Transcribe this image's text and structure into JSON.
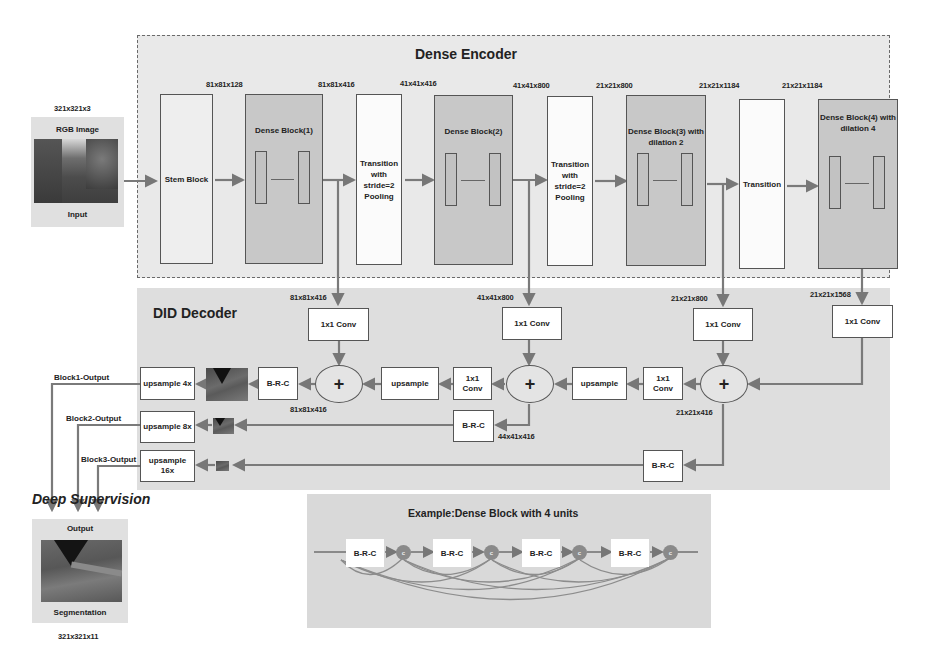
{
  "encoder": {
    "title": "Dense Encoder",
    "input": {
      "dim": "321x321x3",
      "top_label": "RGB Image",
      "bottom_label": "Input"
    },
    "blocks": [
      {
        "id": "stem",
        "label": "Stem Block"
      },
      {
        "id": "dense1",
        "label": "Dense Block(1)"
      },
      {
        "id": "trans1",
        "label": "Transition with stride=2 Pooling"
      },
      {
        "id": "dense2",
        "label": "Dense Block(2)"
      },
      {
        "id": "trans2",
        "label": "Transition with stride=2 Pooling"
      },
      {
        "id": "dense3",
        "label": "Dense Block(3) with dilation 2"
      },
      {
        "id": "trans3",
        "label": "Transition"
      },
      {
        "id": "dense4",
        "label": "Dense Block(4) with dilation 4"
      }
    ],
    "dims": [
      "81x81x128",
      "81x81x416",
      "41x41x416",
      "41x41x800",
      "21x21x800",
      "21x21x1184",
      "21x21x1184"
    ]
  },
  "decoder": {
    "title": "DID Decoder",
    "skip_dims": [
      "81x81x416",
      "41x41x800",
      "21x21x800",
      "21x21x1568"
    ],
    "conv_label": "1x1 Conv",
    "conv_small_label": "1x1 Conv",
    "upsample_label": "upsample",
    "brc_label": "B-R-C",
    "plus_symbol": "+",
    "sum_dims": [
      "81x81x416",
      "44x41x416",
      "21x21x416"
    ],
    "upsample_outputs": [
      "upsample 4x",
      "upsample 8x",
      "upsample 16x"
    ],
    "output_labels": [
      "Block1-Output",
      "Block2-Output",
      "Block3-Output"
    ]
  },
  "deep_supervision": {
    "title": "Deep Supervision",
    "top_label": "Output",
    "bottom_label": "Segmentation",
    "dim": "321x321x11"
  },
  "example": {
    "title": "Example:Dense Block with 4 units",
    "unit_label": "B-R-C",
    "concat_label": "c",
    "units": 4
  }
}
